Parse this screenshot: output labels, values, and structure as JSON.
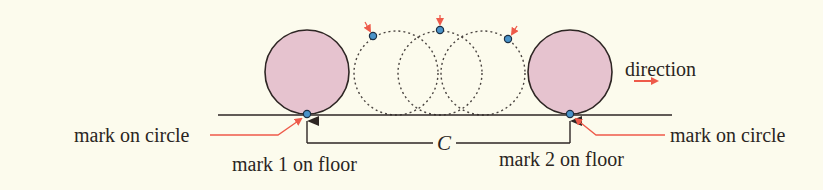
{
  "diagram": {
    "colors": {
      "background": "#fcfbed",
      "solid_circle_fill": "#e6c3cf",
      "solid_circle_stroke": "#2e2624",
      "dashed_circle_stroke": "#4a4440",
      "floor_line": "#2e2624",
      "mark_dot_fill": "#4a93c9",
      "mark_dot_stroke": "#1c2f44",
      "accent_arrow": "#ee5a4a",
      "text": "#2a2522"
    },
    "labels": {
      "mark_on_circle_left": "mark on circle",
      "mark_on_circle_right": "mark on circle",
      "mark1_floor": "mark 1 on floor",
      "mark2_floor": "mark 2 on floor",
      "circumference": "C",
      "direction": "direction"
    },
    "geometry": {
      "floor_y": 115,
      "radius": 42,
      "start_circle_cx": 307,
      "end_circle_cx": 570,
      "intermediate_circle_cx": [
        396,
        440,
        483
      ],
      "intermediate_mark_positions": [
        [
          373,
          36
        ],
        [
          440,
          30
        ],
        [
          508,
          39
        ]
      ]
    }
  }
}
